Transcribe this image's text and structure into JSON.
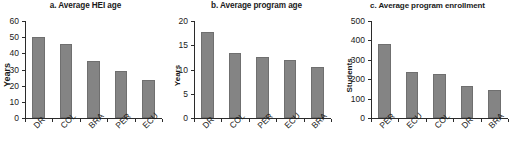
{
  "figure": {
    "background_color": "#ffffff",
    "bar_color": "#848484",
    "axis_color": "#2b2b2b"
  },
  "chart_data": [
    {
      "type": "bar",
      "panel": "a",
      "title": "a. Average HEI age",
      "xlabel": "",
      "ylabel": "Years",
      "categories": [
        "DR",
        "COL",
        "BRA",
        "PER",
        "ECU"
      ],
      "values": [
        50,
        46,
        35.5,
        29,
        23.5
      ],
      "ylim": [
        0,
        60
      ],
      "yticks": [
        0,
        10,
        20,
        30,
        40,
        50,
        60
      ],
      "ytick_labels": [
        "0",
        "10",
        "20",
        "30",
        "40",
        "50",
        "60"
      ],
      "grid": false,
      "legend": "none"
    },
    {
      "type": "bar",
      "panel": "b",
      "title": "b. Average program age",
      "xlabel": "",
      "ylabel": "Years",
      "categories": [
        "DR",
        "COL",
        "PER",
        "ECU",
        "BRA"
      ],
      "values": [
        17.8,
        13.4,
        12.5,
        11.9,
        10.5
      ],
      "ylim": [
        0,
        20
      ],
      "yticks": [
        0,
        5,
        10,
        15,
        20
      ],
      "ytick_labels": [
        "0",
        "5",
        "10",
        "15",
        "20"
      ],
      "grid": false,
      "legend": "none"
    },
    {
      "type": "bar",
      "panel": "c",
      "title": "c. Average program enrollment",
      "xlabel": "",
      "ylabel": "Students",
      "categories": [
        "PER",
        "ECU",
        "COL",
        "DR",
        "BRA"
      ],
      "values": [
        380,
        237,
        227,
        165,
        143
      ],
      "ylim": [
        0,
        500
      ],
      "yticks": [
        0,
        100,
        200,
        300,
        400,
        500
      ],
      "ytick_labels": [
        "0",
        "100",
        "200",
        "300",
        "400",
        "500"
      ],
      "grid": false,
      "legend": "none"
    }
  ]
}
